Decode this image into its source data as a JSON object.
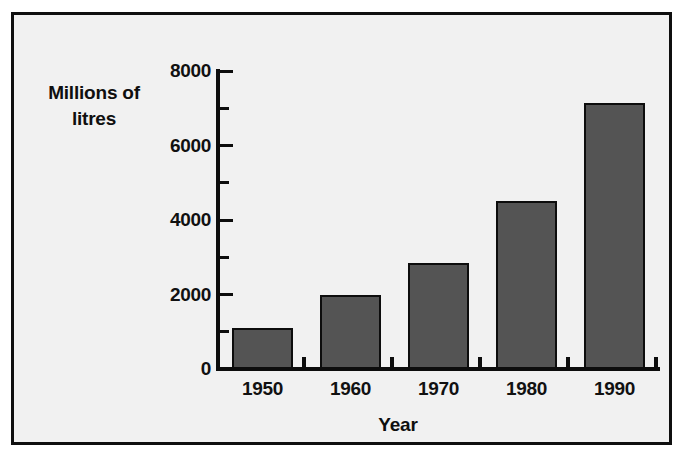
{
  "chart_data": {
    "type": "bar",
    "title": "",
    "xlabel": "Year",
    "ylabel": "Millions of litres",
    "ylabel_line1": "Millions of",
    "ylabel_line2": "litres",
    "categories": [
      "1950",
      "1960",
      "1970",
      "1980",
      "1990"
    ],
    "values": [
      1100,
      2000,
      2850,
      4500,
      7150
    ],
    "ylim": [
      0,
      8000
    ],
    "ytick_labels": [
      "0",
      "2000",
      "4000",
      "6000",
      "8000"
    ],
    "ytick_values": [
      0,
      2000,
      4000,
      6000,
      8000
    ],
    "yminor_tick_values": [
      1000,
      3000,
      5000,
      7000
    ],
    "grid": false,
    "legend": false,
    "bar_color": "#545454",
    "bar_edge_color": "#0d0d0d",
    "axis_color": "#0d0d0d",
    "background_color": "#f1f1f1",
    "frame_color": "#0f0f0f"
  }
}
